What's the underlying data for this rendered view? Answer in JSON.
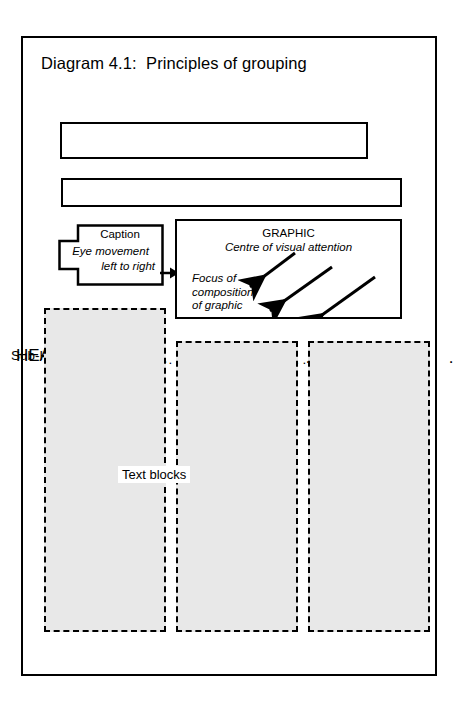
{
  "diagram": {
    "title": "Diagram 4.1:  Principles of grouping"
  },
  "heading_box": {
    "label": "HEADING",
    "dots": ". . . . . . . . . . . . . . ."
  },
  "subheading_box": {
    "label": "Sub-Heading",
    "dots": "............................."
  },
  "caption_box": {
    "title": "Caption",
    "line1": "Eye movement",
    "line2": "left to right",
    "connector_icon": "right-arrow-icon"
  },
  "graphic_box": {
    "title": "GRAPHIC",
    "subtitle": "Centre of visual attention",
    "focus_text": "Focus of\ncomposition\nof graphic",
    "arrow_icon": "diagonal-arrow-icon",
    "arrow_count": 3
  },
  "text_blocks": {
    "label": "Text blocks",
    "count": 3,
    "fill_color": "#e8e8e8",
    "border_style": "dashed"
  },
  "colors": {
    "ink": "#000000",
    "paper": "#ffffff",
    "block_fill": "#e8e8e8"
  }
}
